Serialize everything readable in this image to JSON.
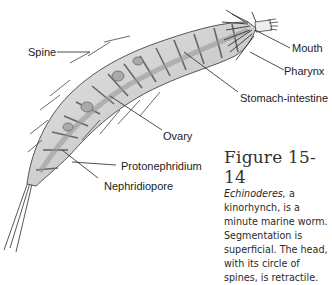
{
  "figure": {
    "labels": {
      "spine": "Spine",
      "mouth": "Mouth",
      "pharynx": "Pharynx",
      "stomach_intestine": "Stomach-intestine",
      "ovary": "Ovary",
      "protonephridium": "Protonephridium",
      "nephridiopore": "Nephridiopore"
    },
    "caption": {
      "title": "Figure 15-14",
      "genus": "Echinoderes,",
      "body": " a kinorhynch, is a minute marine worm. Segmentation is superficial. The head, with its circle of spines, is retractile."
    }
  }
}
